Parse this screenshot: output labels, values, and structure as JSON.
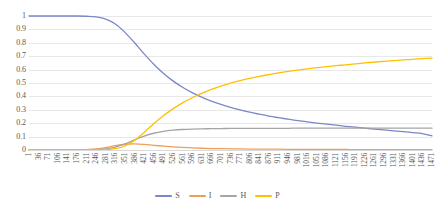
{
  "chart_data": {
    "type": "line",
    "title": "",
    "subtitle": "",
    "xlabel": "",
    "ylabel": "",
    "ylim": [
      0,
      1
    ],
    "xlim": [
      1,
      1471
    ],
    "grid": true,
    "legend_position": "bottom",
    "y_ticks": [
      "0",
      "0.1",
      "0.2",
      "0.3",
      "0.4",
      "0.5",
      "0.6",
      "0.7",
      "0.8",
      "0.9",
      "1"
    ],
    "x_tick_step": 35,
    "categories": [
      1,
      36,
      71,
      106,
      141,
      176,
      211,
      246,
      281,
      316,
      351,
      386,
      421,
      456,
      491,
      526,
      561,
      596,
      631,
      666,
      701,
      736,
      771,
      806,
      841,
      876,
      911,
      946,
      981,
      1016,
      1051,
      1086,
      1121,
      1156,
      1191,
      1226,
      1261,
      1296,
      1331,
      1366,
      1401,
      1436,
      1471
    ],
    "series": [
      {
        "name": "S",
        "color": "#7b87c6",
        "values": [
          1.0,
          1.0,
          1.0,
          1.0,
          1.0,
          1.0,
          0.998,
          0.993,
          0.977,
          0.94,
          0.878,
          0.8,
          0.717,
          0.64,
          0.573,
          0.516,
          0.468,
          0.428,
          0.394,
          0.365,
          0.34,
          0.318,
          0.299,
          0.282,
          0.267,
          0.253,
          0.241,
          0.23,
          0.22,
          0.21,
          0.201,
          0.193,
          0.185,
          0.177,
          0.17,
          0.163,
          0.156,
          0.15,
          0.143,
          0.137,
          0.13,
          0.123,
          0.105
        ]
      },
      {
        "name": "I",
        "color": "#ed9f5a",
        "values": [
          0.0,
          0.0,
          0.0,
          0.0,
          0.0,
          0.001,
          0.003,
          0.008,
          0.018,
          0.032,
          0.043,
          0.046,
          0.042,
          0.035,
          0.029,
          0.023,
          0.019,
          0.016,
          0.013,
          0.011,
          0.01,
          0.009,
          0.008,
          0.007,
          0.007,
          0.006,
          0.006,
          0.005,
          0.005,
          0.005,
          0.004,
          0.004,
          0.004,
          0.004,
          0.003,
          0.003,
          0.003,
          0.003,
          0.003,
          0.003,
          0.002,
          0.002,
          0.002
        ]
      },
      {
        "name": "H",
        "color": "#a5a5a5",
        "values": [
          0.0,
          0.0,
          0.0,
          0.0,
          0.0,
          0.0,
          0.001,
          0.003,
          0.009,
          0.022,
          0.045,
          0.076,
          0.104,
          0.125,
          0.139,
          0.148,
          0.153,
          0.156,
          0.158,
          0.159,
          0.16,
          0.161,
          0.161,
          0.162,
          0.162,
          0.162,
          0.162,
          0.162,
          0.163,
          0.163,
          0.163,
          0.163,
          0.163,
          0.163,
          0.163,
          0.163,
          0.163,
          0.163,
          0.163,
          0.163,
          0.163,
          0.163,
          0.163
        ]
      },
      {
        "name": "P",
        "color": "#ffc000",
        "values": [
          0.0,
          0.0,
          0.0,
          0.0,
          0.0,
          0.0,
          0.0,
          0.001,
          0.003,
          0.01,
          0.03,
          0.072,
          0.131,
          0.196,
          0.255,
          0.307,
          0.352,
          0.39,
          0.423,
          0.452,
          0.477,
          0.499,
          0.518,
          0.535,
          0.55,
          0.563,
          0.575,
          0.586,
          0.596,
          0.605,
          0.614,
          0.622,
          0.629,
          0.636,
          0.643,
          0.65,
          0.656,
          0.662,
          0.667,
          0.672,
          0.677,
          0.682,
          0.686
        ]
      }
    ]
  },
  "legend": {
    "items": [
      {
        "label": "S",
        "color": "#7b87c6"
      },
      {
        "label": "I",
        "color": "#ed9f5a"
      },
      {
        "label": "H",
        "color": "#a5a5a5"
      },
      {
        "label": "P",
        "color": "#ffc000"
      }
    ]
  },
  "colors": {
    "gridline": "#e8e8e8",
    "axis": "#d9d9d9",
    "tick_text": "#595959",
    "background": "#ffffff"
  }
}
